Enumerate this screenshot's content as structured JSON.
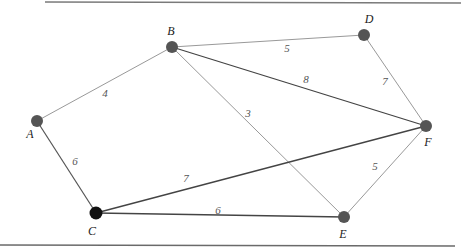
{
  "diagram": {
    "type": "weighted-undirected-graph",
    "rules": {
      "top": {
        "x1": 45,
        "y1": 2,
        "x2": 461,
        "y2": 3,
        "color": "#7a7a7a"
      },
      "bottom": {
        "x1": 0,
        "y1": 245,
        "x2": 455,
        "y2": 246,
        "color": "#6a6a6a"
      }
    },
    "nodes": [
      {
        "id": "A",
        "label": "A",
        "x": 37,
        "y": 121,
        "r": 6,
        "fill": "#555555",
        "lx": 30,
        "ly": 138
      },
      {
        "id": "B",
        "label": "B",
        "x": 172,
        "y": 47,
        "r": 6,
        "fill": "#555555",
        "lx": 171,
        "ly": 35
      },
      {
        "id": "C",
        "label": "C",
        "x": 96,
        "y": 213,
        "r": 6.5,
        "fill": "#111111",
        "lx": 92,
        "ly": 235
      },
      {
        "id": "D",
        "label": "D",
        "x": 364,
        "y": 35,
        "r": 6,
        "fill": "#555555",
        "lx": 369,
        "ly": 23
      },
      {
        "id": "E",
        "label": "E",
        "x": 344,
        "y": 217,
        "r": 6,
        "fill": "#555555",
        "lx": 343,
        "ly": 238
      },
      {
        "id": "F",
        "label": "F",
        "x": 426,
        "y": 126,
        "r": 6,
        "fill": "#555555",
        "lx": 428,
        "ly": 146
      }
    ],
    "edges": [
      {
        "from": "A",
        "to": "B",
        "weight": "4",
        "color": "#999999",
        "width": 1,
        "lx": 105,
        "ly": 97
      },
      {
        "from": "A",
        "to": "C",
        "weight": "6",
        "color": "#555555",
        "width": 1.2,
        "lx": 75,
        "ly": 165
      },
      {
        "from": "B",
        "to": "D",
        "weight": "5",
        "color": "#999999",
        "width": 1,
        "lx": 287,
        "ly": 52
      },
      {
        "from": "B",
        "to": "F",
        "weight": "8",
        "color": "#444444",
        "width": 1.3,
        "lx": 306,
        "ly": 83
      },
      {
        "from": "B",
        "to": "E",
        "weight": "3",
        "color": "#999999",
        "width": 1,
        "lx": 248,
        "ly": 117
      },
      {
        "from": "C",
        "to": "F",
        "weight": "7",
        "color": "#444444",
        "width": 1.3,
        "lx": 186,
        "ly": 182
      },
      {
        "from": "C",
        "to": "E",
        "weight": "6",
        "color": "#444444",
        "width": 1.3,
        "lx": 218,
        "ly": 214
      },
      {
        "from": "D",
        "to": "F",
        "weight": "7",
        "color": "#999999",
        "width": 1,
        "lx": 385,
        "ly": 85
      },
      {
        "from": "E",
        "to": "F",
        "weight": "5",
        "color": "#999999",
        "width": 1,
        "lx": 375,
        "ly": 170
      }
    ]
  }
}
